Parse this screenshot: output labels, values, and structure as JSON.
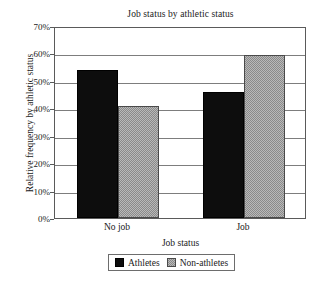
{
  "chart_data": {
    "type": "bar",
    "title": "Job status by athletic status",
    "xlabel": "Job status",
    "ylabel": "Relative frequency by athletic status",
    "categories": [
      "No job",
      "Job"
    ],
    "series": [
      {
        "name": "Athletes",
        "values": [
          54,
          46
        ],
        "color": "#0d0d0d",
        "fill": "solid-black"
      },
      {
        "name": "Non-athletes",
        "values": [
          41,
          59.5
        ],
        "color": "#b9b9b9",
        "fill": "gray-checker"
      }
    ],
    "ylim": [
      0,
      70
    ],
    "ytick_values": [
      0,
      10,
      20,
      30,
      40,
      50,
      60,
      70
    ],
    "ytick_labels": [
      "0%",
      "10%",
      "20%",
      "30%",
      "40%",
      "50%",
      "60%",
      "70%"
    ],
    "grid": "horizontal",
    "legend_position": "bottom-center",
    "legend_entries": [
      "Athletes",
      "Non-athletes"
    ],
    "value_unit": "percent"
  },
  "legend": {
    "items": [
      {
        "label": "Athletes",
        "swatch": "black-swatch-icon"
      },
      {
        "label": "Non-athletes",
        "swatch": "gray-swatch-icon"
      }
    ]
  }
}
